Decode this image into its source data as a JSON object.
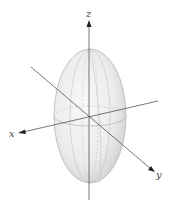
{
  "diagram": {
    "type": "3d-ellipsoid",
    "axes": {
      "x": {
        "label": "x"
      },
      "y": {
        "label": "y"
      },
      "z": {
        "label": "z"
      }
    },
    "colors": {
      "axis": "#555555",
      "surface_light": "#f4f4f4",
      "surface_dark": "#cfcfcf",
      "outline": "#b8b8b8",
      "grid": "#bdbdbd",
      "label": "#444444"
    }
  }
}
